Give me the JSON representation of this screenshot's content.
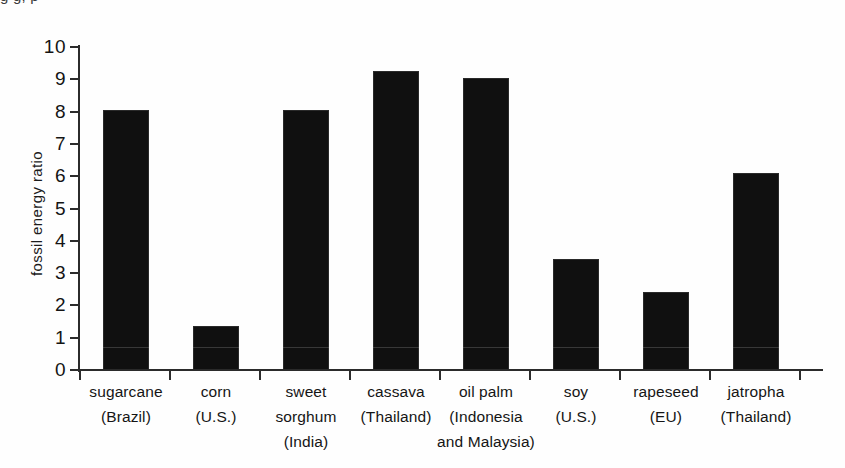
{
  "page": {
    "top_bleed_text": "g                               g,                                    p"
  },
  "chart_data": {
    "type": "bar",
    "title": "",
    "xlabel": "",
    "ylabel": "fossil energy ratio",
    "ylim": [
      0,
      10
    ],
    "ytick_step": 1,
    "grid": false,
    "legend": null,
    "categories": [
      "sugarcane (Brazil)",
      "corn (U.S.)",
      "sweet sorghum (India)",
      "cassava (Thailand)",
      "oil palm (Indonesia and Malaysia)",
      "soy (U.S.)",
      "rapeseed (EU)",
      "jatropha (Thailand)"
    ],
    "category_lines": [
      [
        "sugarcane",
        "(Brazil)"
      ],
      [
        "corn",
        "(U.S.)"
      ],
      [
        "sweet",
        "sorghum",
        "(India)"
      ],
      [
        "cassava",
        "(Thailand)"
      ],
      [
        "oil palm",
        "(Indonesia",
        "and Malaysia)"
      ],
      [
        "soy",
        "(U.S.)"
      ],
      [
        "rapeseed",
        "(EU)"
      ],
      [
        "jatropha",
        "(Thailand)"
      ]
    ],
    "values": [
      8.05,
      1.35,
      8.05,
      9.25,
      9.05,
      3.45,
      2.4,
      6.1
    ],
    "ytick_labels": [
      "0",
      "1",
      "2",
      "3",
      "4",
      "5",
      "6",
      "7",
      "8",
      "9",
      "10"
    ],
    "bar_color": "#101010",
    "axis_color": "#2b2b2b"
  }
}
